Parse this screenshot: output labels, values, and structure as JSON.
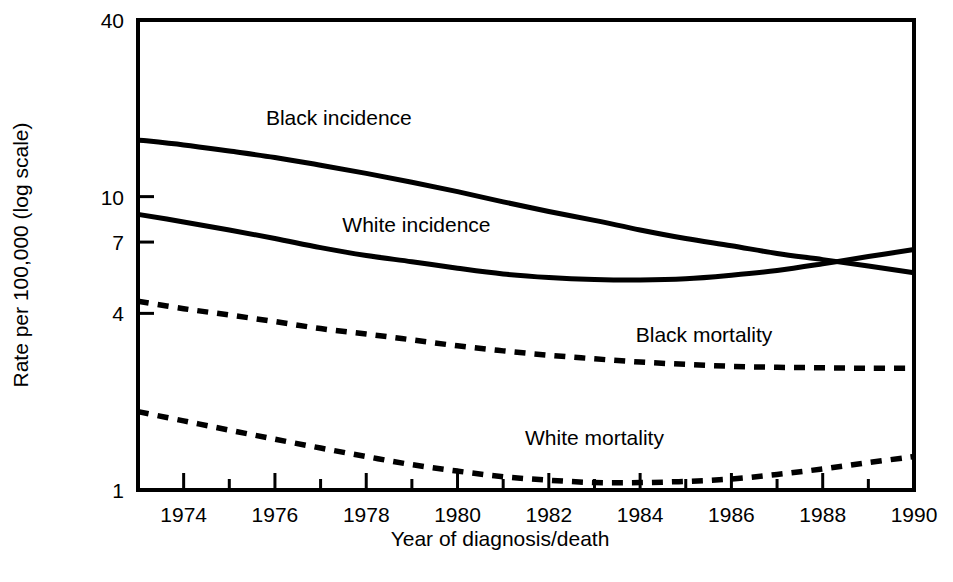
{
  "chart_data": {
    "type": "line",
    "title": "",
    "xlabel": "Year of diagnosis/death",
    "ylabel": "Rate per 100,000 (log scale)",
    "yscale": "log",
    "ylim": [
      1,
      40
    ],
    "xlim": [
      1973,
      1990
    ],
    "grid": false,
    "legend_position": "inline-labels",
    "y_ticks": [
      {
        "value": 40,
        "label": "40"
      },
      {
        "value": 10,
        "label": "10"
      },
      {
        "value": 7,
        "label": "7"
      },
      {
        "value": 4,
        "label": "4"
      },
      {
        "value": 1,
        "label": "1"
      }
    ],
    "x_ticks": [
      {
        "value": 1973,
        "label": ""
      },
      {
        "value": 1974,
        "label": "1974"
      },
      {
        "value": 1975,
        "label": ""
      },
      {
        "value": 1976,
        "label": "1976"
      },
      {
        "value": 1977,
        "label": ""
      },
      {
        "value": 1978,
        "label": "1978"
      },
      {
        "value": 1979,
        "label": ""
      },
      {
        "value": 1980,
        "label": "1980"
      },
      {
        "value": 1981,
        "label": ""
      },
      {
        "value": 1982,
        "label": "1982"
      },
      {
        "value": 1983,
        "label": ""
      },
      {
        "value": 1984,
        "label": "1984"
      },
      {
        "value": 1985,
        "label": ""
      },
      {
        "value": 1986,
        "label": "1986"
      },
      {
        "value": 1987,
        "label": ""
      },
      {
        "value": 1988,
        "label": "1988"
      },
      {
        "value": 1989,
        "label": ""
      },
      {
        "value": 1990,
        "label": "1990"
      }
    ],
    "x": [
      1973,
      1974,
      1975,
      1976,
      1977,
      1978,
      1979,
      1980,
      1981,
      1982,
      1983,
      1984,
      1985,
      1986,
      1987,
      1988,
      1989,
      1990
    ],
    "series": [
      {
        "name": "Black incidence",
        "style": "solid",
        "label_x": 1977.4,
        "label_y": 17.5,
        "values": [
          15.6,
          15.0,
          14.3,
          13.6,
          12.8,
          12.0,
          11.2,
          10.4,
          9.6,
          8.9,
          8.3,
          7.7,
          7.2,
          6.8,
          6.4,
          6.1,
          5.8,
          5.5
        ]
      },
      {
        "name": "White incidence",
        "style": "solid",
        "label_x": 1979.1,
        "label_y": 7.6,
        "values": [
          8.7,
          8.2,
          7.7,
          7.2,
          6.7,
          6.3,
          6.0,
          5.7,
          5.45,
          5.3,
          5.22,
          5.2,
          5.25,
          5.4,
          5.6,
          5.9,
          6.25,
          6.6
        ]
      },
      {
        "name": "Black mortality",
        "style": "dashed",
        "label_x": 1985.4,
        "label_y": 3.2,
        "values": [
          4.4,
          4.15,
          3.95,
          3.75,
          3.55,
          3.4,
          3.25,
          3.1,
          2.98,
          2.88,
          2.8,
          2.73,
          2.68,
          2.64,
          2.62,
          2.61,
          2.6,
          2.6
        ]
      },
      {
        "name": "White mortality",
        "style": "dashed",
        "label_x": 1983.0,
        "label_y": 1.42,
        "values": [
          1.85,
          1.72,
          1.6,
          1.49,
          1.39,
          1.3,
          1.22,
          1.16,
          1.11,
          1.08,
          1.06,
          1.06,
          1.07,
          1.09,
          1.13,
          1.18,
          1.24,
          1.3
        ]
      }
    ]
  }
}
